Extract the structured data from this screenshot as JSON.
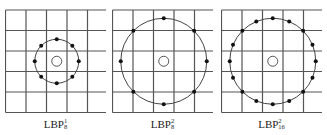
{
  "figure": {
    "panels": [
      {
        "label": {
          "base": "LBP",
          "sub": "8",
          "sup": "1"
        },
        "neighbors": 8,
        "radius": 1,
        "circle_radius_px": 22,
        "left_px": 5
      },
      {
        "label": {
          "base": "LBP",
          "sub": "8",
          "sup": "2"
        },
        "neighbors": 8,
        "radius": 2,
        "circle_radius_px": 43,
        "left_px": 112
      },
      {
        "label": {
          "base": "LBP",
          "sub": "16",
          "sup": "2"
        },
        "neighbors": 16,
        "radius": 2,
        "circle_radius_px": 43,
        "left_px": 221
      }
    ],
    "grid": {
      "rows": 5,
      "cols": 5,
      "cell_px": 20.5,
      "top_px": 10
    },
    "colors": {
      "grid": "#555555",
      "circle": "#444444",
      "point": "#111111",
      "center": "#555555"
    }
  }
}
